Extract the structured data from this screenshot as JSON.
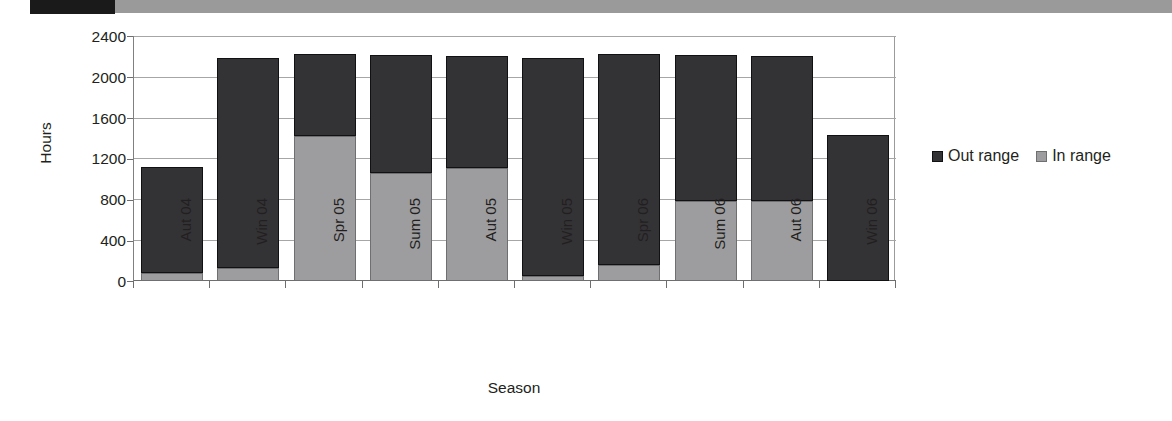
{
  "top_bar": {
    "black_segment_label": "scan-artifact-black",
    "gray_segment_label": "scan-artifact-gray"
  },
  "chart_data": {
    "type": "bar",
    "stacked": true,
    "title": "",
    "xlabel": "Season",
    "ylabel": "Hours",
    "ylim": [
      0,
      2400
    ],
    "ytick_step": 400,
    "yticks": [
      "2400",
      "2000",
      "1600",
      "1200",
      "800",
      "400",
      "0"
    ],
    "grid": true,
    "legend_position": "right",
    "categories": [
      "Aut 04",
      "Win 04",
      "Spr 05",
      "Sum 05",
      "Aut 05",
      "Win 05",
      "Spr 06",
      "Sum 06",
      "Aut 06",
      "Win 06"
    ],
    "series": [
      {
        "name": "Out range",
        "color": "#333336",
        "values": [
          1040,
          2050,
          800,
          1150,
          1090,
          2130,
          2060,
          1430,
          1420,
          1430
        ]
      },
      {
        "name": "In range",
        "color": "#9d9d9f",
        "values": [
          80,
          130,
          1420,
          1060,
          1110,
          50,
          160,
          780,
          780,
          0
        ]
      }
    ],
    "totals": [
      1120,
      2180,
      2220,
      2210,
      2200,
      2180,
      2220,
      2210,
      2200,
      1430
    ]
  },
  "legend": {
    "entries": [
      {
        "label": "Out range",
        "swatch": "dark-square-icon"
      },
      {
        "label": "In range",
        "swatch": "gray-square-icon"
      }
    ]
  }
}
